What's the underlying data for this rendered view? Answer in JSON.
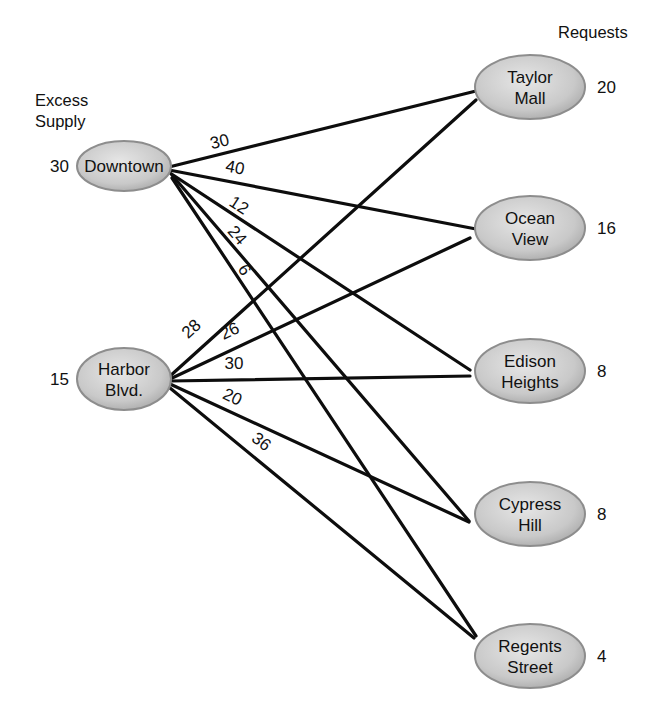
{
  "headings": {
    "supply_line1": "Excess",
    "supply_line2": "Supply",
    "requests": "Requests"
  },
  "colors": {
    "edge": "#0d0d0d",
    "node_fill_light": "#e4e4e4",
    "node_fill_dark": "#a9a9a9",
    "node_stroke": "#8d8d8d",
    "text": "#111111"
  },
  "sources": [
    {
      "id": "downtown",
      "lines": [
        "Downtown"
      ],
      "supply": "30",
      "cx": 124,
      "cy": 166,
      "rx": 47,
      "ry": 25
    },
    {
      "id": "harbor",
      "lines": [
        "Harbor",
        "Blvd."
      ],
      "supply": "15",
      "cx": 124,
      "cy": 379,
      "rx": 47,
      "ry": 31
    }
  ],
  "destinations": [
    {
      "id": "taylor",
      "lines": [
        "Taylor",
        "Mall"
      ],
      "request": "20",
      "cx": 530,
      "cy": 87,
      "rx": 55,
      "ry": 32
    },
    {
      "id": "ocean",
      "lines": [
        "Ocean",
        "View"
      ],
      "request": "16",
      "cx": 530,
      "cy": 228,
      "rx": 55,
      "ry": 32
    },
    {
      "id": "edison",
      "lines": [
        "Edison",
        "Heights"
      ],
      "request": "8",
      "cx": 530,
      "cy": 371,
      "rx": 55,
      "ry": 32
    },
    {
      "id": "cypress",
      "lines": [
        "Cypress",
        "Hill"
      ],
      "request": "8",
      "cx": 530,
      "cy": 514,
      "rx": 55,
      "ry": 32
    },
    {
      "id": "regents",
      "lines": [
        "Regents",
        "Street"
      ],
      "request": "4",
      "cx": 530,
      "cy": 656,
      "rx": 55,
      "ry": 32
    }
  ],
  "edges": [
    {
      "from": "downtown",
      "to": "taylor",
      "cost": "30",
      "x1": 169,
      "y1": 167,
      "x2": 476,
      "y2": 91,
      "lx": 221,
      "ly": 147,
      "rot": -14
    },
    {
      "from": "downtown",
      "to": "ocean",
      "cost": "40",
      "x1": 169,
      "y1": 170,
      "x2": 476,
      "y2": 229,
      "lx": 234,
      "ly": 173,
      "rot": 11
    },
    {
      "from": "downtown",
      "to": "edison",
      "cost": "12",
      "x1": 170,
      "y1": 173,
      "x2": 470,
      "y2": 370,
      "lx": 236,
      "ly": 210,
      "rot": 33
    },
    {
      "from": "downtown",
      "to": "cypress",
      "cost": "24",
      "x1": 172,
      "y1": 175,
      "x2": 469,
      "y2": 521,
      "lx": 233,
      "ly": 239,
      "rot": 49
    },
    {
      "from": "downtown",
      "to": "regents",
      "cost": "6",
      "x1": 172,
      "y1": 178,
      "x2": 476,
      "y2": 636,
      "lx": 240,
      "ly": 273,
      "rot": 56
    },
    {
      "from": "harbor",
      "to": "taylor",
      "cost": "28",
      "x1": 169,
      "y1": 377,
      "x2": 476,
      "y2": 100,
      "lx": 195,
      "ly": 333,
      "rot": -42
    },
    {
      "from": "harbor",
      "to": "ocean",
      "cost": "26",
      "x1": 170,
      "y1": 379,
      "x2": 470,
      "y2": 238,
      "lx": 232,
      "ly": 336,
      "rot": -25
    },
    {
      "from": "harbor",
      "to": "edison",
      "cost": "30",
      "x1": 170,
      "y1": 381,
      "x2": 470,
      "y2": 376,
      "lx": 234,
      "ly": 369,
      "rot": 0
    },
    {
      "from": "harbor",
      "to": "cypress",
      "cost": "20",
      "x1": 170,
      "y1": 384,
      "x2": 469,
      "y2": 522,
      "lx": 230,
      "ly": 402,
      "rot": 25
    },
    {
      "from": "harbor",
      "to": "regents",
      "cost": "36",
      "x1": 170,
      "y1": 388,
      "x2": 474,
      "y2": 638,
      "lx": 258,
      "ly": 446,
      "rot": 38
    }
  ]
}
